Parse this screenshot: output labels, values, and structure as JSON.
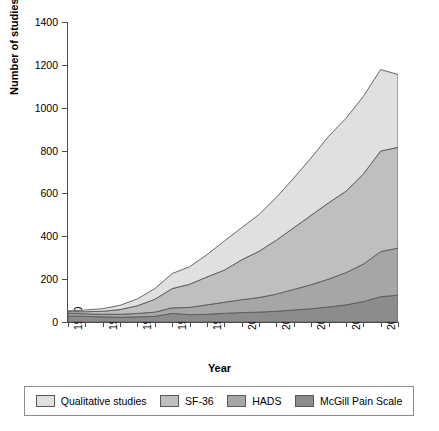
{
  "chart_data": {
    "type": "area",
    "stacked": true,
    "title": "",
    "xlabel": "Year",
    "ylabel": "Number of studies",
    "xlim": [
      1990,
      2009
    ],
    "ylim": [
      0,
      1400
    ],
    "ytick_values": [
      0,
      200,
      400,
      600,
      800,
      1000,
      1200,
      1400
    ],
    "ytick_labels": [
      "0",
      "200",
      "400",
      "600",
      "800",
      "1000",
      "1200",
      "1400"
    ],
    "x": [
      1990,
      1991,
      1992,
      1993,
      1994,
      1995,
      1996,
      1997,
      1998,
      1999,
      2000,
      2001,
      2002,
      2003,
      2004,
      2005,
      2006,
      2007,
      2008,
      2009
    ],
    "xtick_values": [
      1990,
      1992,
      1994,
      1996,
      1998,
      2000,
      2002,
      2004,
      2006,
      2008
    ],
    "xtick_labels": [
      "1990",
      "1992",
      "1994",
      "1996",
      "1998",
      "2000",
      "2002",
      "2004",
      "2006",
      "2008"
    ],
    "grid": false,
    "legend_position": "bottom",
    "series": [
      {
        "name": "McGill Pain Scale",
        "color": "#8c8c8c",
        "order": 1,
        "values": [
          28,
          26,
          24,
          22,
          24,
          26,
          40,
          34,
          36,
          40,
          44,
          46,
          50,
          56,
          62,
          70,
          80,
          95,
          118,
          125
        ]
      },
      {
        "name": "HADS",
        "color": "#a6a6a6",
        "order": 2,
        "values": [
          12,
          12,
          12,
          14,
          16,
          20,
          26,
          34,
          44,
          52,
          60,
          68,
          80,
          96,
          112,
          130,
          150,
          175,
          210,
          220
        ]
      },
      {
        "name": "SF-36",
        "color": "#bfbfbf",
        "order": 3,
        "values": [
          8,
          10,
          14,
          22,
          36,
          60,
          90,
          108,
          130,
          150,
          186,
          216,
          252,
          288,
          324,
          356,
          380,
          420,
          470,
          470
        ]
      },
      {
        "name": "Qualitative studies",
        "color": "#e0e0e0",
        "order": 4,
        "values": [
          4,
          8,
          12,
          20,
          32,
          50,
          70,
          82,
          104,
          136,
          150,
          172,
          200,
          232,
          268,
          310,
          340,
          362,
          380,
          340
        ]
      }
    ],
    "cumulative_totals": [
      52,
      56,
      62,
      78,
      108,
      156,
      226,
      258,
      314,
      378,
      440,
      502,
      582,
      672,
      766,
      866,
      950,
      1052,
      1178,
      1155
    ]
  },
  "legend": {
    "items": [
      {
        "label": "Qualitative studies",
        "color": "#e0e0e0"
      },
      {
        "label": "SF-36",
        "color": "#bfbfbf"
      },
      {
        "label": "HADS",
        "color": "#a6a6a6"
      },
      {
        "label": "McGill Pain Scale",
        "color": "#8c8c8c"
      }
    ]
  },
  "axis_style": {
    "line_color": "#4d4d4d",
    "outline_color": "#595959"
  }
}
